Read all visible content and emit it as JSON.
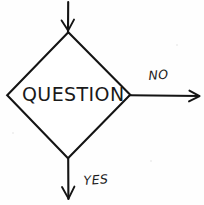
{
  "diagram": {
    "type": "flowchart-decision",
    "style": "hand-drawn ink on paper",
    "background_color": "#fefefe",
    "ink_color": "#141414",
    "nodes": [
      {
        "id": "decision",
        "shape": "diamond",
        "label": "QUESTION",
        "vertices": {
          "top": [
            68,
            32
          ],
          "right": [
            130,
            95
          ],
          "bottom": [
            68,
            158
          ],
          "left": [
            7,
            95
          ]
        }
      }
    ],
    "edges": [
      {
        "id": "edge-in",
        "label": "",
        "direction": "down",
        "from": [
          68,
          2
        ],
        "to": [
          68,
          32
        ],
        "arrowhead_at": "end"
      },
      {
        "id": "edge-no",
        "label": "NO",
        "direction": "right",
        "from": [
          130,
          95
        ],
        "to": [
          199,
          95
        ],
        "arrowhead_at": "end"
      },
      {
        "id": "edge-yes",
        "label": "YES",
        "direction": "down",
        "from": [
          68,
          158
        ],
        "to": [
          68,
          199
        ],
        "arrowhead_at": "end"
      }
    ],
    "labels": {
      "decision_text": "QUESTION",
      "branch_no": "NO",
      "branch_yes": "YES"
    }
  }
}
